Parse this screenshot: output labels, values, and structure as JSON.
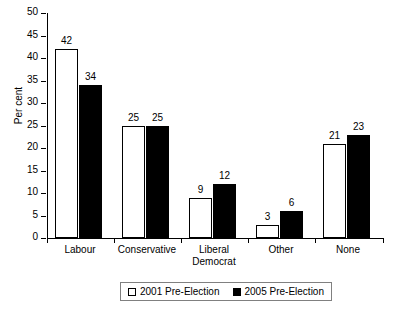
{
  "chart_data": {
    "type": "bar",
    "title": "",
    "subtitle": "",
    "xlabel": "",
    "ylabel": "Per cent",
    "ylim": [
      0,
      50
    ],
    "ytick_step": 5,
    "yticks": [
      0,
      5,
      10,
      15,
      20,
      25,
      30,
      35,
      40,
      45,
      50
    ],
    "grid": false,
    "legend_position": "bottom",
    "categories": [
      "Labour",
      "Conservative",
      "Liberal Democrat",
      "Other",
      "None"
    ],
    "category_lines": [
      [
        "Labour"
      ],
      [
        "Conservative"
      ],
      [
        "Liberal",
        "Democrat"
      ],
      [
        "Other"
      ],
      [
        "None"
      ]
    ],
    "series": [
      {
        "name": "2001 Pre-Election",
        "color": "#ffffff",
        "edge_color": "#000000",
        "values": [
          42,
          25,
          9,
          3,
          21
        ]
      },
      {
        "name": "2005 Pre-Election",
        "color": "#000000",
        "edge_color": "#000000",
        "values": [
          34,
          25,
          12,
          6,
          23
        ]
      }
    ],
    "data_labels": [
      [
        "42",
        "34"
      ],
      [
        "25",
        "25"
      ],
      [
        "9",
        "12"
      ],
      [
        "3",
        "6"
      ],
      [
        "21",
        "23"
      ]
    ]
  },
  "axis": {
    "y_title": "Per cent",
    "y_tick_labels": [
      "0",
      "5",
      "10",
      "15",
      "20",
      "25",
      "30",
      "35",
      "40",
      "45",
      "50"
    ]
  },
  "legend": {
    "items": [
      {
        "label": "2001 Pre-Election",
        "swatch": "open-square-icon"
      },
      {
        "label": "2005 Pre-Election",
        "swatch": "filled-square-icon"
      }
    ]
  }
}
